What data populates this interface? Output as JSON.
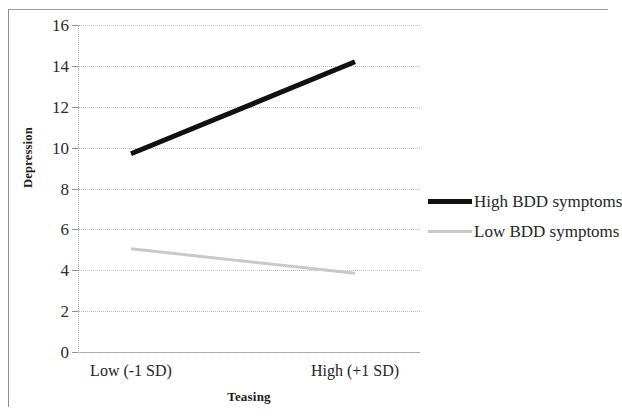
{
  "chart_data": {
    "type": "line",
    "title": "",
    "subtitle": "",
    "xlabel": "Teasing",
    "ylabel": "Depression",
    "categories": [
      "Low (-1 SD)",
      "High (+1 SD)"
    ],
    "ylim": [
      0,
      16
    ],
    "ytick_step": 2,
    "yticks": [
      16,
      14,
      12,
      10,
      8,
      6,
      4,
      2,
      0
    ],
    "ytick_labels": [
      "16",
      "14",
      "12",
      "10",
      "8",
      "6",
      "4",
      "2",
      "0"
    ],
    "grid": true,
    "grid_axis": "y",
    "grid_style": "dotted",
    "legend_position": "right",
    "series": [
      {
        "name": "High BDD symptoms",
        "values": [
          9.7,
          14.2
        ],
        "color": "#111111",
        "line_width": 5
      },
      {
        "name": "Low BDD symptoms",
        "values": [
          5.05,
          3.85
        ],
        "color": "#c9c9c9",
        "line_width": 3
      }
    ]
  },
  "axes": {
    "y_title": "Depression",
    "x_title": "Teasing"
  },
  "legend": {
    "items": [
      {
        "label": "High BDD symptoms",
        "color": "#111111",
        "thickness": "5px"
      },
      {
        "label": "Low BDD symptoms",
        "color": "#c9c9c9",
        "thickness": "3px"
      }
    ]
  },
  "colors": {
    "high_bdd_line": "#111111",
    "low_bdd_line": "#c9c9c9",
    "gridline": "#b9b9b9",
    "axis": "#9e9e9e",
    "text": "#242424",
    "background": "#ffffff",
    "frame": "#8d8d8d"
  }
}
